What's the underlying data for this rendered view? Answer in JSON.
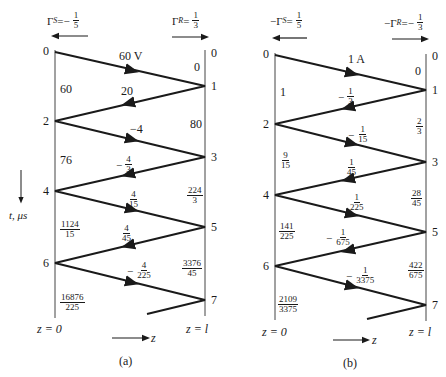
{
  "clipped_header_text": "",
  "diagrams": [
    {
      "caption": "(a)",
      "source_reflection": {
        "prefix": "Γ",
        "sub": "S",
        "eq": " = ",
        "sign": "−",
        "num": "1",
        "den": "5"
      },
      "load_reflection": {
        "prefix": "Γ",
        "sub": "R",
        "eq": " = ",
        "sign": "",
        "num": "1",
        "den": "3"
      },
      "incident_label": "60 V",
      "left_times": [
        "0",
        "2",
        "4",
        "6"
      ],
      "right_times": [
        "0",
        "1",
        "3",
        "5",
        "7"
      ],
      "wave_values": [
        {
          "sign": "",
          "num": "20",
          "den": ""
        },
        {
          "sign": "",
          "num": "−4",
          "den": ""
        },
        {
          "sign": "−",
          "num": "4",
          "den": "3"
        },
        {
          "sign": "",
          "num": "4",
          "den": "15"
        },
        {
          "sign": "",
          "num": "4",
          "den": "45"
        },
        {
          "sign": "−",
          "num": "4",
          "den": "225"
        }
      ],
      "left_totals": [
        {
          "num": "60",
          "den": ""
        },
        {
          "num": "76",
          "den": ""
        },
        {
          "num": "1124",
          "den": "15"
        },
        {
          "num": "16876",
          "den": "225"
        }
      ],
      "right_totals": [
        {
          "num": "0",
          "den": ""
        },
        {
          "num": "80",
          "den": ""
        },
        {
          "num": "224",
          "den": "3"
        },
        {
          "num": "3376",
          "den": "45"
        }
      ],
      "z_start": "z = 0",
      "z_end": "z = l",
      "z_axis": "z"
    },
    {
      "caption": "(b)",
      "source_reflection": {
        "prefix": "−Γ",
        "sub": "S",
        "eq": " = ",
        "sign": "",
        "num": "1",
        "den": "5"
      },
      "load_reflection": {
        "prefix": "−Γ",
        "sub": "R",
        "eq": " = ",
        "sign": "−",
        "num": "1",
        "den": "3"
      },
      "incident_label": "1 A",
      "left_times": [
        "0",
        "2",
        "4",
        "6"
      ],
      "right_times": [
        "0",
        "1",
        "3",
        "5",
        "7"
      ],
      "wave_values": [
        {
          "sign": "−",
          "num": "1",
          "den": "3"
        },
        {
          "sign": "−",
          "num": "1",
          "den": "15"
        },
        {
          "sign": "",
          "num": "1",
          "den": "45"
        },
        {
          "sign": "",
          "num": "1",
          "den": "225"
        },
        {
          "sign": "−",
          "num": "1",
          "den": "675"
        },
        {
          "sign": "−",
          "num": "1",
          "den": "3375"
        }
      ],
      "left_totals": [
        {
          "num": "1",
          "den": ""
        },
        {
          "num": "9",
          "den": "15"
        },
        {
          "num": "141",
          "den": "225"
        },
        {
          "num": "2109",
          "den": "3375"
        }
      ],
      "right_totals": [
        {
          "num": "0",
          "den": ""
        },
        {
          "num": "2",
          "den": "3"
        },
        {
          "num": "28",
          "den": "45"
        },
        {
          "num": "422",
          "den": "675"
        }
      ],
      "z_start": "z = 0",
      "z_end": "z = l",
      "z_axis": "z"
    }
  ],
  "time_axis_label": "t, μs"
}
